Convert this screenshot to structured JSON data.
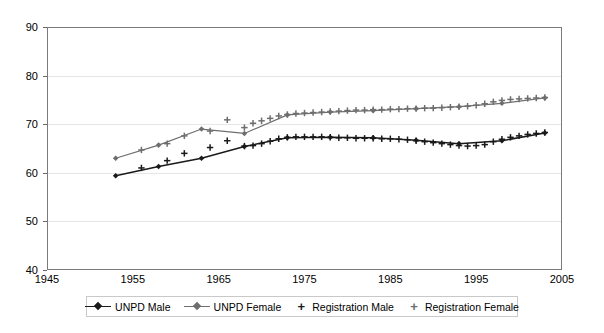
{
  "chart_data": {
    "type": "line",
    "title": "",
    "subtitle": "",
    "xlabel": "",
    "ylabel": "",
    "xlim": [
      1945,
      2005
    ],
    "ylim": [
      40,
      90
    ],
    "xticks": [
      1945,
      1955,
      1965,
      1975,
      1985,
      1995,
      2005
    ],
    "yticks": [
      40,
      50,
      60,
      70,
      80,
      90
    ],
    "grid": true,
    "legend_position": "bottom",
    "colors": {
      "unpd_male": "#1a1a1a",
      "unpd_female": "#6e6e6e",
      "registration_male": "#1a1a1a",
      "registration_female": "#6e6e6e",
      "frame": "#7a7a7a",
      "gridline": "#e6e6e6"
    },
    "series": [
      {
        "name": "UNPD Male",
        "marker": "diamond",
        "style": "line-marker",
        "color": "#1a1a1a",
        "x": [
          1953,
          1958,
          1963,
          1968,
          1973,
          1978,
          1983,
          1988,
          1993,
          1998,
          2003
        ],
        "values": [
          59.4,
          61.3,
          63.0,
          65.4,
          67.2,
          67.3,
          67.2,
          66.7,
          66.0,
          66.6,
          68.2
        ]
      },
      {
        "name": "UNPD Female",
        "marker": "diamond",
        "style": "line-marker",
        "color": "#6e6e6e",
        "x": [
          1953,
          1958,
          1963,
          1968,
          1973,
          1978,
          1983,
          1988,
          1993,
          1998,
          2003
        ],
        "values": [
          63.0,
          65.7,
          69.0,
          68.1,
          71.9,
          72.5,
          72.8,
          73.2,
          73.6,
          74.3,
          75.4
        ]
      },
      {
        "name": "Registration Male",
        "marker": "plus",
        "style": "markers-only",
        "color": "#1a1a1a",
        "x": [
          1956,
          1959,
          1961,
          1964,
          1966,
          1968,
          1969,
          1970,
          1971,
          1972,
          1973,
          1974,
          1975,
          1976,
          1977,
          1978,
          1979,
          1980,
          1981,
          1982,
          1983,
          1984,
          1985,
          1986,
          1987,
          1988,
          1989,
          1990,
          1991,
          1992,
          1993,
          1994,
          1995,
          1996,
          1997,
          1998,
          1999,
          2000,
          2001,
          2002,
          2003
        ],
        "values": [
          61.0,
          62.5,
          64.0,
          65.2,
          66.6,
          65.5,
          65.6,
          66.0,
          66.5,
          67.0,
          67.3,
          67.4,
          67.4,
          67.4,
          67.4,
          67.3,
          67.2,
          67.2,
          67.1,
          67.1,
          67.1,
          67.0,
          67.0,
          66.9,
          66.8,
          66.6,
          66.4,
          66.2,
          66.0,
          65.8,
          65.6,
          65.5,
          65.6,
          65.8,
          66.4,
          66.9,
          67.3,
          67.6,
          67.9,
          68.1,
          68.3
        ]
      },
      {
        "name": "Registration Female",
        "marker": "plus",
        "style": "markers-only",
        "color": "#6e6e6e",
        "x": [
          1956,
          1959,
          1961,
          1964,
          1966,
          1968,
          1969,
          1970,
          1971,
          1972,
          1973,
          1974,
          1975,
          1976,
          1977,
          1978,
          1979,
          1980,
          1981,
          1982,
          1983,
          1984,
          1985,
          1986,
          1987,
          1988,
          1989,
          1990,
          1991,
          1992,
          1993,
          1994,
          1995,
          1996,
          1997,
          1998,
          1999,
          2000,
          2001,
          2002,
          2003
        ],
        "values": [
          64.7,
          66.0,
          67.6,
          68.6,
          70.9,
          69.3,
          70.2,
          70.7,
          71.2,
          71.7,
          72.0,
          72.2,
          72.3,
          72.4,
          72.5,
          72.6,
          72.7,
          72.8,
          72.9,
          72.9,
          73.0,
          73.0,
          73.1,
          73.1,
          73.2,
          73.2,
          73.3,
          73.3,
          73.4,
          73.5,
          73.6,
          73.7,
          73.9,
          74.2,
          74.6,
          74.9,
          75.1,
          75.2,
          75.3,
          75.4,
          75.5
        ]
      }
    ],
    "legend": [
      {
        "label": "UNPD Male",
        "marker": "line-diamond",
        "color": "#1a1a1a"
      },
      {
        "label": "UNPD Female",
        "marker": "line-diamond",
        "color": "#6e6e6e"
      },
      {
        "label": "Registration Male",
        "marker": "plus",
        "color": "#1a1a1a"
      },
      {
        "label": "Registration Female",
        "marker": "plus",
        "color": "#6e6e6e"
      }
    ]
  }
}
